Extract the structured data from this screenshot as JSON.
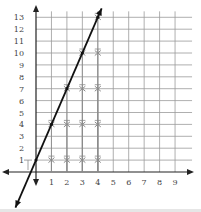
{
  "chart_data": {
    "type": "line",
    "title": "",
    "xlabel": "",
    "ylabel": "",
    "x_ticks": [
      1,
      2,
      3,
      4,
      5,
      6,
      7,
      8,
      9
    ],
    "y_ticks": [
      1,
      2,
      3,
      4,
      5,
      6,
      7,
      8,
      9,
      10,
      11,
      12,
      13
    ],
    "xlim": [
      -1.3,
      10
    ],
    "ylim": [
      -1.9,
      13.5
    ],
    "grid": true,
    "legend": null,
    "series": [
      {
        "name": "line",
        "type": "line",
        "equation": "y = 3x + 1",
        "x": [
          0,
          1,
          2,
          3,
          4
        ],
        "y": [
          1,
          4,
          7,
          10,
          13
        ],
        "arrows": "both"
      },
      {
        "name": "marks",
        "type": "scatter",
        "marker": "cross",
        "points": [
          [
            1,
            1
          ],
          [
            2,
            1
          ],
          [
            3,
            1
          ],
          [
            4,
            1
          ],
          [
            1,
            4
          ],
          [
            2,
            4
          ],
          [
            3,
            4
          ],
          [
            4,
            4
          ],
          [
            2,
            7
          ],
          [
            3,
            7
          ],
          [
            4,
            7
          ],
          [
            3,
            10
          ],
          [
            4,
            10
          ],
          [
            4,
            13
          ]
        ]
      }
    ]
  },
  "colors": {
    "grid": "#9a9a9a",
    "axis": "#222222",
    "line": "#111111",
    "marker": "#8a8a8a",
    "label": "#444444"
  }
}
